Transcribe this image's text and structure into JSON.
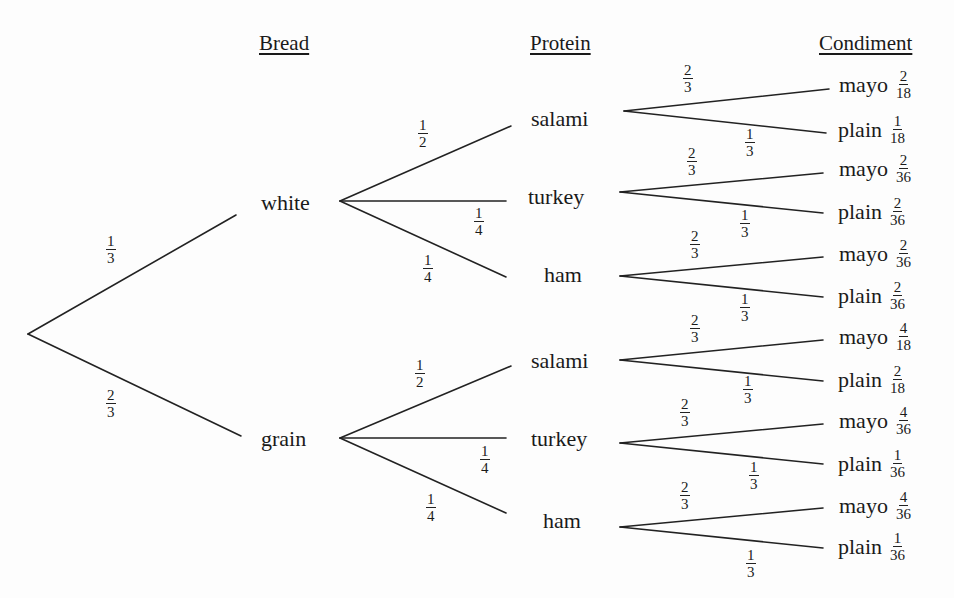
{
  "headers": {
    "bread": "Bread",
    "protein": "Protein",
    "condiment": "Condiment"
  },
  "root_edges": [
    {
      "num": "1",
      "den": "3"
    },
    {
      "num": "2",
      "den": "3"
    }
  ],
  "breads": [
    {
      "label": "white",
      "edges": [
        {
          "num": "1",
          "den": "2"
        },
        {
          "num": "1",
          "den": "4"
        },
        {
          "num": "1",
          "den": "4"
        }
      ],
      "proteins": [
        {
          "label": "salami",
          "edges": [
            {
              "num": "2",
              "den": "3"
            },
            {
              "num": "1",
              "den": "3"
            }
          ],
          "leaves": [
            {
              "label": "mayo",
              "num": "2",
              "den": "18"
            },
            {
              "label": "plain",
              "num": "1",
              "den": "18"
            }
          ]
        },
        {
          "label": "turkey",
          "edges": [
            {
              "num": "2",
              "den": "3"
            },
            {
              "num": "1",
              "den": "3"
            }
          ],
          "leaves": [
            {
              "label": "mayo",
              "num": "2",
              "den": "36"
            },
            {
              "label": "plain",
              "num": "2",
              "den": "36"
            }
          ]
        },
        {
          "label": "ham",
          "edges": [
            {
              "num": "2",
              "den": "3"
            },
            {
              "num": "1",
              "den": "3"
            }
          ],
          "leaves": [
            {
              "label": "mayo",
              "num": "2",
              "den": "36"
            },
            {
              "label": "plain",
              "num": "2",
              "den": "36"
            }
          ]
        }
      ]
    },
    {
      "label": "grain",
      "edges": [
        {
          "num": "1",
          "den": "2"
        },
        {
          "num": "1",
          "den": "4"
        },
        {
          "num": "1",
          "den": "4"
        }
      ],
      "proteins": [
        {
          "label": "salami",
          "edges": [
            {
              "num": "2",
              "den": "3"
            },
            {
              "num": "1",
              "den": "3"
            }
          ],
          "leaves": [
            {
              "label": "mayo",
              "num": "4",
              "den": "18"
            },
            {
              "label": "plain",
              "num": "2",
              "den": "18"
            }
          ]
        },
        {
          "label": "turkey",
          "edges": [
            {
              "num": "2",
              "den": "3"
            },
            {
              "num": "1",
              "den": "3"
            }
          ],
          "leaves": [
            {
              "label": "mayo",
              "num": "4",
              "den": "36"
            },
            {
              "label": "plain",
              "num": "1",
              "den": "36"
            }
          ]
        },
        {
          "label": "ham",
          "edges": [
            {
              "num": "2",
              "den": "3"
            },
            {
              "num": "1",
              "den": "3"
            }
          ],
          "leaves": [
            {
              "label": "mayo",
              "num": "4",
              "den": "36"
            },
            {
              "label": "plain",
              "num": "1",
              "den": "36"
            }
          ]
        }
      ]
    }
  ]
}
